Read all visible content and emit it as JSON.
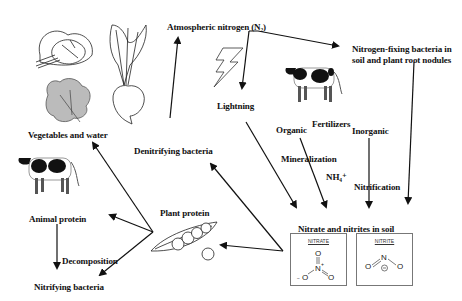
{
  "diagram": {
    "nodes": {
      "vegetables": "Vegetables and water",
      "atmospheric": "Atmospheric nitrogen (N₂)",
      "nfixing_l1": "Nitrogen-fixing bacteria in",
      "nfixing_l2": "soil and plant root nodules",
      "lightning": "Lightning",
      "organic": "Organic",
      "fertilizers": "Fertilizers",
      "inorganic": "Inorganic",
      "denitrifying": "Denitrifying bacteria",
      "mineralization": "Mineralization",
      "nh4": "NH₄⁺",
      "nitrification": "Nitrification",
      "animal_protein": "Animal protein",
      "plant_protein": "Plant protein",
      "decomposition": "Decomposition",
      "nitrifying": "Nitrifying bacteria",
      "soil": "Nitrate and nitrites in soil"
    },
    "boxes": {
      "nitrate": {
        "title": "NITRATE",
        "formula": "NO₃⁻"
      },
      "nitrite": {
        "title": "NITRITE",
        "formula": "NO₂⁻"
      }
    },
    "icons": [
      "vegetables-illustration",
      "beet-illustration",
      "lightning-icon",
      "cow-image",
      "pea-pod-illustration"
    ]
  }
}
